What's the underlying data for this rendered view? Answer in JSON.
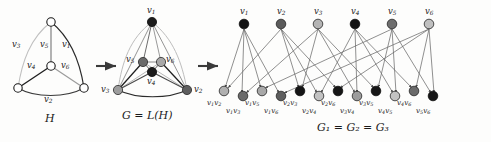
{
  "figure": {
    "panels": [
      {
        "id": "H",
        "caption": "H"
      },
      {
        "id": "G",
        "caption": "G = L(H)"
      },
      {
        "id": "G1",
        "caption": "G₁ = G₂ = G₃"
      }
    ],
    "arrows": [
      "arrow-1",
      "arrow-2"
    ]
  },
  "panelH": {
    "caption_main": "H",
    "edge_labels": [
      {
        "name": "v1",
        "base": "v",
        "sub": "1"
      },
      {
        "name": "v2",
        "base": "v",
        "sub": "2"
      },
      {
        "name": "v3",
        "base": "v",
        "sub": "3"
      },
      {
        "name": "v4",
        "base": "v",
        "sub": "4"
      },
      {
        "name": "v5",
        "base": "v",
        "sub": "5"
      },
      {
        "name": "v6",
        "base": "v",
        "sub": "6"
      }
    ],
    "vertices": [
      "top",
      "center",
      "bottom-left",
      "bottom-right"
    ]
  },
  "panelG": {
    "caption_G": "G",
    "caption_eq": "=",
    "caption_L": "L(H)",
    "caption_full": "G = L(H)",
    "node_labels": [
      {
        "name": "v1",
        "base": "v",
        "sub": "1",
        "color": "#1c1c1c"
      },
      {
        "name": "v2",
        "base": "v",
        "sub": "2",
        "color": "#5e5e5e"
      },
      {
        "name": "v3",
        "base": "v",
        "sub": "3",
        "color": "#9d9d9d"
      },
      {
        "name": "v4",
        "base": "v",
        "sub": "4",
        "color": "#1c1c1c"
      },
      {
        "name": "v5",
        "base": "v",
        "sub": "5",
        "color": "#6a6a6a"
      },
      {
        "name": "v6",
        "base": "v",
        "sub": "6",
        "color": "#a8a8a8"
      }
    ]
  },
  "panelBipartite": {
    "caption_full": "G₁ = G₂ = G₃",
    "top_nodes": [
      {
        "name": "v1",
        "base": "v",
        "sub": "1",
        "color": "#141414"
      },
      {
        "name": "v2",
        "base": "v",
        "sub": "2",
        "color": "#5b5b5b"
      },
      {
        "name": "v3",
        "base": "v",
        "sub": "3",
        "color": "#b4b4b4"
      },
      {
        "name": "v4",
        "base": "v",
        "sub": "4",
        "color": "#141414"
      },
      {
        "name": "v5",
        "base": "v",
        "sub": "5",
        "color": "#6e6e6e"
      },
      {
        "name": "v6",
        "base": "v",
        "sub": "6",
        "color": "#c0c0c0"
      }
    ],
    "bottom_nodes": [
      {
        "name": "v1v2",
        "parts": [
          "v",
          "1",
          "v",
          "2"
        ],
        "color": "#b0b0b0",
        "row": "upper"
      },
      {
        "name": "v1v3",
        "parts": [
          "v",
          "1",
          "v",
          "3"
        ],
        "color": "#6a6a6a",
        "row": "lower"
      },
      {
        "name": "v1v5",
        "parts": [
          "v",
          "1",
          "v",
          "5"
        ],
        "color": "#a8a8a8",
        "row": "upper"
      },
      {
        "name": "v1v6",
        "parts": [
          "v",
          "1",
          "v",
          "6"
        ],
        "color": "#5e5e5e",
        "row": "lower"
      },
      {
        "name": "v2v3",
        "parts": [
          "v",
          "2",
          "v",
          "3"
        ],
        "color": "#161616",
        "row": "upper"
      },
      {
        "name": "v2v4",
        "parts": [
          "v",
          "2",
          "v",
          "4"
        ],
        "color": "#c2c2c2",
        "row": "lower"
      },
      {
        "name": "v2v6",
        "parts": [
          "v",
          "2",
          "v",
          "6"
        ],
        "color": "#161616",
        "row": "upper"
      },
      {
        "name": "v3v4",
        "parts": [
          "v",
          "3",
          "v",
          "4"
        ],
        "color": "#9c9c9c",
        "row": "lower"
      },
      {
        "name": "v3v5",
        "parts": [
          "v",
          "3",
          "v",
          "5"
        ],
        "color": "#161616",
        "row": "upper"
      },
      {
        "name": "v4v5",
        "parts": [
          "v",
          "4",
          "v",
          "5"
        ],
        "color": "#c2c2c2",
        "row": "lower"
      },
      {
        "name": "v4v6",
        "parts": [
          "v",
          "4",
          "v",
          "6"
        ],
        "color": "#6a6a6a",
        "row": "upper"
      },
      {
        "name": "v5v6",
        "parts": [
          "v",
          "5",
          "v",
          "6"
        ],
        "color": "#161616",
        "row": "lower"
      }
    ]
  },
  "colors": {
    "ink": "#1a1a1a",
    "edge_dark": "#2b2b2b",
    "edge_light": "#b5b5b5",
    "edge_mid": "#8a8a8a",
    "node_stroke": "#1a1a1a",
    "background": "#fdfdfc"
  }
}
